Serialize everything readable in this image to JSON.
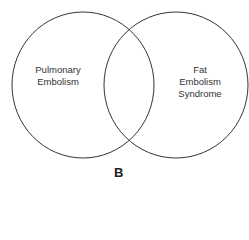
{
  "diagram": {
    "type": "venn",
    "sets": [
      {
        "label_lines": [
          "Pulmonary",
          "Embolism"
        ]
      },
      {
        "label_lines": [
          "Fat",
          "Embolism",
          "Syndrome"
        ]
      }
    ],
    "panel_label": "B",
    "stroke_color": "#333333"
  }
}
